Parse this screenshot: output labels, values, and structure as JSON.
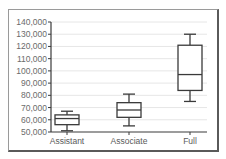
{
  "chart_data": {
    "type": "boxplot",
    "title": "",
    "xlabel": "",
    "ylabel": "",
    "categories": [
      "Assistant",
      "Associate",
      "Full"
    ],
    "y_ticks": [
      "50,000",
      "60,000",
      "70,000",
      "80,000",
      "90,000",
      "100,000",
      "110,000",
      "120,000",
      "130,000",
      "140,000"
    ],
    "ylim": [
      50000,
      140000
    ],
    "grid": true,
    "legend": "none",
    "boxes": [
      {
        "category": "Assistant",
        "whisker_low": 51000,
        "q1": 56000,
        "median": 61000,
        "q3": 64000,
        "whisker_high": 67000
      },
      {
        "category": "Associate",
        "whisker_low": 55000,
        "q1": 62000,
        "median": 68000,
        "q3": 74000,
        "whisker_high": 81000
      },
      {
        "category": "Full",
        "whisker_low": 75000,
        "q1": 84000,
        "median": 97000,
        "q3": 121000,
        "whisker_high": 130000
      }
    ],
    "colors": {
      "box_stroke": "#3a3a3a",
      "grid": "#e6e6e6",
      "axis": "#3a3a3a",
      "text": "#6b6b6b"
    }
  }
}
